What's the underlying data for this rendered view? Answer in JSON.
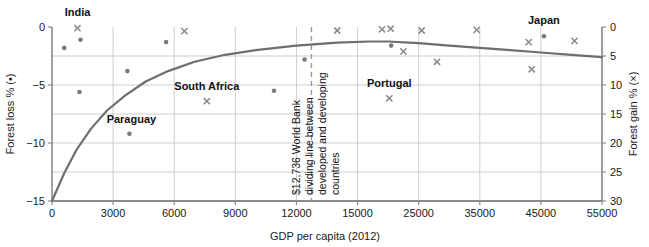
{
  "chart_data": {
    "type": "scatter",
    "title": "",
    "xlabel": "GDP per capita (2012)",
    "ylabel_left": "Forest loss % (•)",
    "ylabel_right": "Forest gain % (×)",
    "grid": true,
    "legend": "none",
    "x_ticks": [
      {
        "label": "0",
        "value": 0
      },
      {
        "label": "3000",
        "value": 3000
      },
      {
        "label": "6000",
        "value": 6000
      },
      {
        "label": "9000",
        "value": 9000
      },
      {
        "label": "12000",
        "value": 12000
      },
      {
        "label": "15000",
        "value": 15000
      },
      {
        "label": "25000",
        "value": 25000
      },
      {
        "label": "35000",
        "value": 35000
      },
      {
        "label": "45000",
        "value": 45000
      },
      {
        "label": "55000",
        "value": 55000
      }
    ],
    "xlim_note": "piecewise axis: even spacing per tick (0-15000 in 3000 steps, then 10000 steps)",
    "y_left_ticks": [
      "0",
      "-5",
      "-10",
      "-15"
    ],
    "y_left_lim": [
      -15,
      0
    ],
    "y_right_ticks": [
      "0",
      "5",
      "10",
      "15",
      "20",
      "25",
      "30"
    ],
    "y_right_lim": [
      30,
      0
    ],
    "series": [
      {
        "name": "Forest loss %",
        "marker": "dot",
        "axis": "left",
        "color": "#7a7a7a",
        "points": [
          {
            "x": 600,
            "y": -1.8
          },
          {
            "x": 1400,
            "y": -1.1
          },
          {
            "x": 1350,
            "y": -5.6
          },
          {
            "x": 3700,
            "y": -3.8
          },
          {
            "x": 3800,
            "y": -9.2
          },
          {
            "x": 5600,
            "y": -1.3
          },
          {
            "x": 10900,
            "y": -5.5
          },
          {
            "x": 12400,
            "y": -2.8
          },
          {
            "x": 20500,
            "y": -1.6
          },
          {
            "x": 45500,
            "y": -0.8
          }
        ]
      },
      {
        "name": "Forest gain %",
        "marker": "cross",
        "axis": "right",
        "color": "#8a8a8a",
        "points": [
          {
            "x": 1250,
            "y": 0.2
          },
          {
            "x": 6500,
            "y": 0.7
          },
          {
            "x": 14000,
            "y": 0.6
          },
          {
            "x": 19000,
            "y": 0.4
          },
          {
            "x": 20400,
            "y": 0.3
          },
          {
            "x": 22500,
            "y": 4.2
          },
          {
            "x": 25500,
            "y": 0.6
          },
          {
            "x": 28000,
            "y": 6.0
          },
          {
            "x": 34500,
            "y": 0.5
          },
          {
            "x": 43000,
            "y": 2.6
          },
          {
            "x": 43500,
            "y": 7.3
          },
          {
            "x": 50500,
            "y": 2.4
          },
          {
            "x": 7600,
            "y": 12.8
          },
          {
            "x": 20200,
            "y": 12.3
          }
        ]
      }
    ],
    "trend_line": {
      "name": "fitted trend",
      "color": "#6e6e6e",
      "description": "rises steeply from -15% at GDP 0, flattens near -1.2% around 13000-20000, then declines slightly to about -2.5% at 55000",
      "points": [
        {
          "x": 0,
          "y": -15.0
        },
        {
          "x": 600,
          "y": -12.6
        },
        {
          "x": 1200,
          "y": -10.6
        },
        {
          "x": 1900,
          "y": -8.8
        },
        {
          "x": 2700,
          "y": -7.2
        },
        {
          "x": 3600,
          "y": -5.9
        },
        {
          "x": 4600,
          "y": -4.7
        },
        {
          "x": 5700,
          "y": -3.8
        },
        {
          "x": 7000,
          "y": -3.0
        },
        {
          "x": 8500,
          "y": -2.4
        },
        {
          "x": 10000,
          "y": -2.0
        },
        {
          "x": 12000,
          "y": -1.6
        },
        {
          "x": 14000,
          "y": -1.35
        },
        {
          "x": 17000,
          "y": -1.25
        },
        {
          "x": 20000,
          "y": -1.25
        },
        {
          "x": 25000,
          "y": -1.4
        },
        {
          "x": 30000,
          "y": -1.6
        },
        {
          "x": 35000,
          "y": -1.8
        },
        {
          "x": 40000,
          "y": -2.0
        },
        {
          "x": 45000,
          "y": -2.2
        },
        {
          "x": 50000,
          "y": -2.4
        },
        {
          "x": 55000,
          "y": -2.6
        }
      ]
    },
    "point_labels": [
      {
        "text": "India",
        "x": 1250,
        "y": 0.2,
        "axis": "right",
        "anchor": "middle",
        "dx": 0,
        "dy": -12
      },
      {
        "text": "Paraguay",
        "x": 3800,
        "y": -9.2,
        "axis": "left",
        "anchor": "middle",
        "dx": 2,
        "dy": -11
      },
      {
        "text": "South Africa",
        "x": 7600,
        "y": 12.8,
        "axis": "right",
        "anchor": "middle",
        "dx": 0,
        "dy": -11
      },
      {
        "text": "Portugal",
        "x": 20200,
        "y": 12.3,
        "axis": "right",
        "anchor": "middle",
        "dx": 0,
        "dy": -11
      },
      {
        "text": "Japan",
        "x": 45500,
        "y": -0.8,
        "axis": "left",
        "anchor": "middle",
        "dx": 0,
        "dy": -12
      }
    ],
    "annotations": [
      {
        "name": "world-bank-divider",
        "x": 12736,
        "style": "dashed vertical line",
        "color": "#9a9a9a",
        "lines": [
          "$12,736 World Bank",
          "dividing line between",
          "developed and developing",
          "countries"
        ]
      }
    ]
  }
}
